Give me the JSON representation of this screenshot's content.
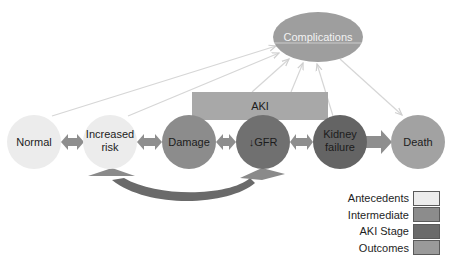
{
  "diagram": {
    "nodes": [
      {
        "id": "normal",
        "label_lines": [
          "Normal"
        ],
        "category": "Antecedents"
      },
      {
        "id": "increased-risk",
        "label_lines": [
          "Increased",
          "risk"
        ],
        "category": "Antecedents"
      },
      {
        "id": "damage",
        "label_lines": [
          "Damage"
        ],
        "category": "Intermediate"
      },
      {
        "id": "gfr",
        "label_lines": [
          "↓GFR"
        ],
        "category": "AKI Stage"
      },
      {
        "id": "kidney-failure",
        "label_lines": [
          "Kidney",
          "failure"
        ],
        "category": "AKI Stage"
      },
      {
        "id": "death",
        "label_lines": [
          "Death"
        ],
        "category": "Outcomes"
      }
    ],
    "complications": {
      "label": "Complications"
    },
    "aki_box": {
      "label": "AKI"
    },
    "edges": [
      {
        "from": "normal",
        "to": "increased-risk",
        "type": "bidirectional"
      },
      {
        "from": "increased-risk",
        "to": "damage",
        "type": "bidirectional"
      },
      {
        "from": "damage",
        "to": "gfr",
        "type": "bidirectional"
      },
      {
        "from": "gfr",
        "to": "kidney-failure",
        "type": "bidirectional"
      },
      {
        "from": "kidney-failure",
        "to": "death",
        "type": "unidirectional"
      },
      {
        "from": "increased-risk",
        "to": "gfr",
        "type": "curved-bidirectional"
      },
      {
        "from": "normal",
        "to": "complications",
        "type": "thin-arrow"
      },
      {
        "from": "increased-risk",
        "to": "complications",
        "type": "thin-arrow"
      },
      {
        "from": "damage",
        "to": "complications",
        "type": "thin-arrow"
      },
      {
        "from": "gfr",
        "to": "complications",
        "type": "thin-arrow"
      },
      {
        "from": "kidney-failure",
        "to": "complications",
        "type": "thin-arrow"
      },
      {
        "from": "complications",
        "to": "death",
        "type": "thin-arrow"
      }
    ]
  },
  "labels": {
    "normal": "Normal",
    "increased_risk_1": "Increased",
    "increased_risk_2": "risk",
    "damage": "Damage",
    "gfr": "↓GFR",
    "kidney_failure_1": "Kidney",
    "kidney_failure_2": "failure",
    "death": "Death",
    "complications": "Complications",
    "aki": "AKI"
  },
  "legend": {
    "items": [
      {
        "label": "Antecedents",
        "color": "#ececec"
      },
      {
        "label": "Intermediate",
        "color": "#8c8c8c"
      },
      {
        "label": "AKI Stage",
        "color": "#6a6a6a"
      },
      {
        "label": "Outcomes",
        "color": "#9a9a9a"
      }
    ]
  },
  "colors": {
    "antecedents": "#ececec",
    "intermediate": "#8c8c8c",
    "aki_stage_gfr": "#707070",
    "aki_stage_failure": "#646464",
    "outcomes": "#a2a2a2",
    "complications": "#9e9e9e",
    "aki_box": "#a8a8a8",
    "arrows": "#8e8e8e",
    "thin_arrows": "#d4d4d4"
  }
}
